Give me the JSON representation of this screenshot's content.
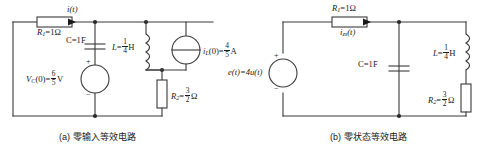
{
  "figure": {
    "kind": "circuit-diagram-pair",
    "subfigures": [
      {
        "id": "a",
        "caption": "(a) 零输入等效电路",
        "elements": {
          "r1_label_name": "R",
          "r1_label_sub": "1",
          "r1_label_value": "=1Ω",
          "current_label": "i(t)",
          "cap_label": "C=1F",
          "vc_label_name": "V",
          "vc_label_sub": "C",
          "vc_label_mid": "(0)=",
          "vc_num": "6",
          "vc_den": "5",
          "vc_unit": "V",
          "ind_label_name": "L",
          "ind_label_eq": "=",
          "ind_num": "1",
          "ind_den": "4",
          "ind_unit": "H",
          "isrc_name": "i",
          "isrc_sub": "L",
          "isrc_mid": "(0)=",
          "isrc_num": "4",
          "isrc_den": "5",
          "isrc_unit": "A",
          "r2_label_name": "R",
          "r2_label_sub": "2",
          "r2_label_eq": "=",
          "r2_num": "3",
          "r2_den": "2",
          "r2_unit": "Ω",
          "plus_sign": "+",
          "minus_sign": "−"
        }
      },
      {
        "id": "b",
        "caption": "(b) 零状态等效电路",
        "elements": {
          "r1_label_name": "R",
          "r1_label_sub": "1",
          "r1_label_value": "=1Ω",
          "current_label_name": "i",
          "current_label_sub": "zs",
          "current_label_tail": "(t)",
          "cap_label": "C=1F",
          "src_name": "e",
          "src_tail": "(t)=4u(t)",
          "ind_label_name": "L",
          "ind_label_eq": "=",
          "ind_num": "1",
          "ind_den": "4",
          "ind_unit": "H",
          "r2_label_name": "R",
          "r2_label_sub": "2",
          "r2_label_eq": "=",
          "r2_num": "3",
          "r2_den": "2",
          "r2_unit": "Ω",
          "plus_sign": "+",
          "minus_sign": "−"
        }
      }
    ],
    "colors": {
      "wire": "#3a3a3a",
      "text": "#1a1a1a",
      "background": "#ffffff"
    }
  }
}
